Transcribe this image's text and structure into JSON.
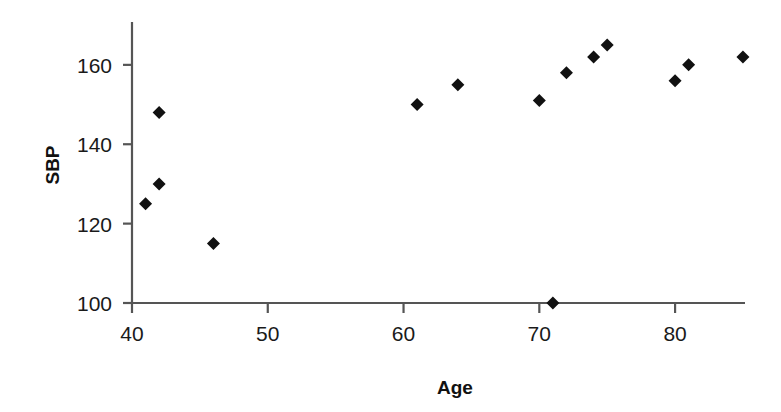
{
  "chart_data": {
    "type": "scatter",
    "title": "",
    "xlabel": "Age",
    "ylabel": "SBP",
    "xlim": [
      40,
      85
    ],
    "ylim": [
      100,
      171
    ],
    "xticks": [
      40,
      50,
      60,
      70,
      80
    ],
    "yticks": [
      100,
      120,
      140,
      160
    ],
    "xticklabels": [
      "40",
      "50",
      "60",
      "70",
      "80"
    ],
    "yticklabels": [
      "100",
      "120",
      "140",
      "160"
    ],
    "grid": false,
    "legend": false,
    "marker": "diamond",
    "marker_color": "#111111",
    "axis_color": "#555555",
    "series": [
      {
        "name": "SBP vs Age",
        "points": [
          {
            "x": 41,
            "y": 125
          },
          {
            "x": 42,
            "y": 130
          },
          {
            "x": 42,
            "y": 148
          },
          {
            "x": 46,
            "y": 115
          },
          {
            "x": 61,
            "y": 150
          },
          {
            "x": 64,
            "y": 155
          },
          {
            "x": 70,
            "y": 151
          },
          {
            "x": 71,
            "y": 100
          },
          {
            "x": 72,
            "y": 158
          },
          {
            "x": 74,
            "y": 162
          },
          {
            "x": 75,
            "y": 165
          },
          {
            "x": 80,
            "y": 156
          },
          {
            "x": 81,
            "y": 160
          },
          {
            "x": 85,
            "y": 162
          }
        ]
      }
    ]
  },
  "geometry": {
    "x_axis_pixel_start": 132,
    "x_axis_pixel_end": 745,
    "x_value_at_start": 40,
    "x_value_at_end": 85.15,
    "y_axis_pixel_bottom": 303,
    "y_axis_pixel_top": 22,
    "y_value_at_bottom": 100,
    "y_value_at_top": 170.8,
    "marker_size": 13,
    "xlabel_x": 455,
    "xlabel_y": 378,
    "ylabel_x": 52,
    "ylabel_y": 165
  }
}
